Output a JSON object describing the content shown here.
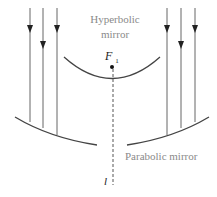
{
  "diagram": {
    "title_fragment": "",
    "labels": {
      "hyperbolic_line1": "Hyperbolic",
      "hyperbolic_line2": "mirror",
      "focus": "F",
      "focus_sub": "1",
      "parabolic": "Parabolic mirror",
      "axis": "l"
    },
    "colors": {
      "line": "#555555",
      "arrow": "#222222",
      "mirror": "#444444",
      "text": "#8a8a8a"
    },
    "incoming_rays_left_x": [
      30,
      43,
      57
    ],
    "incoming_rays_right_x": [
      167,
      181,
      195
    ]
  }
}
